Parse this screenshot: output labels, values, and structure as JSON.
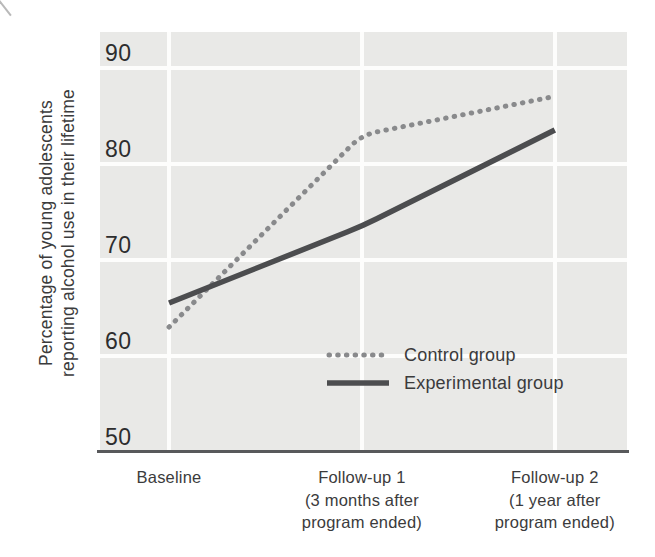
{
  "y_axis": {
    "title_line1": "Percentage of young adolescents",
    "title_line2": "reporting alcohol use in their lifetime",
    "tick_labels": [
      "90",
      "80",
      "70",
      "60",
      "50"
    ]
  },
  "chart_data": {
    "type": "line",
    "title": "",
    "xlabel": "",
    "ylabel": "Percentage of young adolescents reporting alcohol use in their lifetime",
    "categories": [
      "Baseline",
      "Follow-up 1 (3 months after program ended)",
      "Follow-up 2 (1 year after program ended)"
    ],
    "category_labels": [
      [
        "Baseline"
      ],
      [
        "Follow-up 1",
        "(3 months after",
        "program ended)"
      ],
      [
        "Follow-up 2",
        "(1 year after",
        "program ended)"
      ]
    ],
    "yticks": [
      90,
      80,
      70,
      60,
      50
    ],
    "ylim": [
      50,
      93.7
    ],
    "grid": true,
    "plot_background": "#e9e9e7",
    "gridline_color": "#fdfdfc",
    "axis_color": "#58595b",
    "legend_position": "inside-lower-middle",
    "series": [
      {
        "name": "Control group",
        "style": "dotted",
        "color": "#898a8c",
        "values": [
          63,
          83,
          87
        ]
      },
      {
        "name": "Experimental group",
        "style": "solid",
        "color": "#4c4d4f",
        "values": [
          65.5,
          73.5,
          83.5
        ]
      }
    ]
  }
}
